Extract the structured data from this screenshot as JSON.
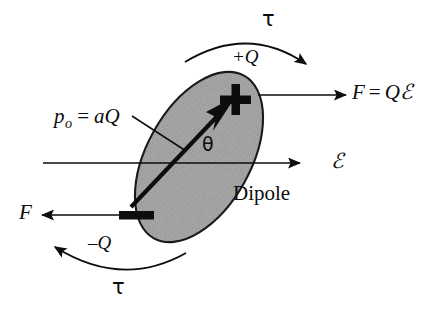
{
  "figure": {
    "body_label": "Dipole",
    "colors": {
      "ink": "#0d0d0d",
      "ellipse_fill": "#a9a9a9",
      "ellipse_stroke": "#1a1a1a",
      "background": "#ffffff"
    }
  },
  "labels": {
    "torque_top": "τ",
    "torque_bottom": "τ",
    "charge_positive": "+Q",
    "charge_negative": "–Q",
    "force_right_F": "F",
    "force_right_eq": "=",
    "force_right_Q": "Q",
    "force_right_E": "ℰ",
    "force_left": "F",
    "field": "ℰ",
    "angle": "θ",
    "dipole_moment_p": "p",
    "dipole_moment_sub": "o",
    "dipole_moment_eq": "=",
    "dipole_moment_a": "a",
    "dipole_moment_Q": "Q",
    "body": "Dipole"
  },
  "geometry": {
    "ellipse": {
      "cx": 199,
      "cy": 157,
      "rx": 52,
      "ry": 93,
      "rotation_deg": 29
    },
    "dipole_axis": {
      "x1": 131,
      "y1": 207,
      "x2": 232,
      "y2": 101
    },
    "field_line": {
      "x1": 43,
      "y1": 163,
      "x2": 300,
      "y2": 163
    },
    "force_positive": {
      "x1": 258,
      "y1": 95,
      "x2": 346,
      "y2": 95
    },
    "force_negative": {
      "x1": 148,
      "y1": 215,
      "x2": 42,
      "y2": 215
    },
    "plus_sign": {
      "cx": 234,
      "cy": 100,
      "size": 30
    },
    "minus_sign": {
      "cx": 136,
      "cy": 215,
      "width": 34
    },
    "leader_line": {
      "x1": 136,
      "y1": 118,
      "x2": 185,
      "y2": 150
    },
    "torque_arc_top": {
      "x1": 185,
      "y1": 60,
      "x2": 309,
      "y2": 63
    },
    "torque_arc_bottom": {
      "x1": 186,
      "y1": 253,
      "x2": 51,
      "y2": 244
    }
  },
  "icons": {
    "arrow_head": "arrowhead-icon",
    "plus_charge": "plus-charge-icon",
    "minus_charge": "minus-charge-icon"
  }
}
